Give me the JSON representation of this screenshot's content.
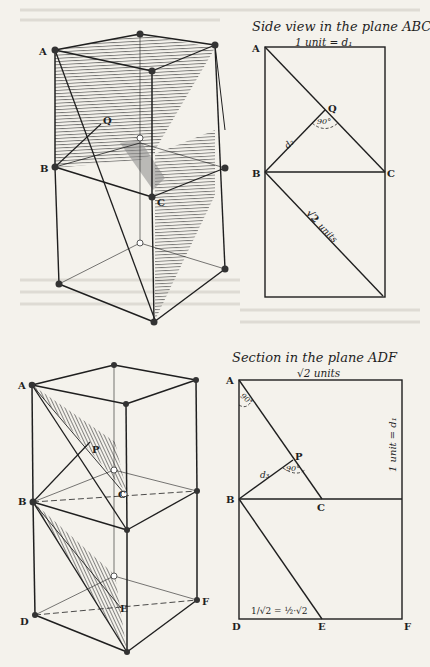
{
  "colors": {
    "paper": "#f4f2ec",
    "ink": "#1f1f1f",
    "faint_text": "#d9d6cf",
    "hatch": "#3a3a3a"
  },
  "figure_top_left": {
    "vertex_labels": {
      "A": "A",
      "Q": "Q",
      "B": "B",
      "C": "C"
    }
  },
  "figure_top_right": {
    "title": "Side view in the plane ABC",
    "top_label": "1 unit = d₁",
    "vertex_labels": {
      "A": "A",
      "Q": "Q",
      "B": "B",
      "C": "C"
    },
    "angle_label": "90°",
    "segment_label_d2": "d₂",
    "diagonal_label_root": "√2",
    "diagonal_label_units": "units"
  },
  "figure_bottom_left": {
    "vertex_labels": {
      "A": "A",
      "P": "P",
      "B": "B",
      "C": "C",
      "D": "D",
      "E": "E",
      "F": "F"
    }
  },
  "figure_bottom_right": {
    "title": "Section in the plane ADF",
    "top_label": "√2 units",
    "side_label": "1 unit = d₁",
    "vertex_labels": {
      "A": "A",
      "P": "P",
      "B": "B",
      "C": "C",
      "D": "D",
      "E": "E",
      "F": "F"
    },
    "angle_label_top": "90°",
    "angle_label_top_sub": "-C",
    "angle_label_p": "90°",
    "segment_label_d3": "d₃",
    "bottom_formula": "1/√2 = ½·√2"
  }
}
